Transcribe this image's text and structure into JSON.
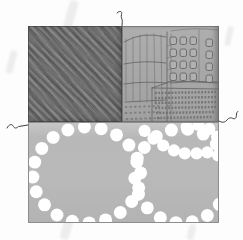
{
  "figure": {
    "kind": "patent-style-figure",
    "panels": [
      {
        "id": "twill-swatch",
        "role": "dark diagonal twill fabric patch, top left"
      },
      {
        "id": "city-sketch-swatch",
        "role": "hand-drawn city buildings fabric patch, top right"
      },
      {
        "id": "dotted-rings-swatch",
        "role": "gray fabric patch with white dotted rings, bottom"
      }
    ],
    "leaders": [
      {
        "id": "leader-top",
        "attaches": "seam between top-left and top-right patches"
      },
      {
        "id": "leader-left",
        "attaches": "left edge of bottom patch"
      },
      {
        "id": "leader-right",
        "attaches": "right edge between top-right and bottom patches"
      }
    ]
  },
  "colors": {
    "page_bg": "#fdfdfd",
    "twill_base": "#6f6f6f",
    "city_bg": "#a9a9a9",
    "sketch_line": "#666666",
    "dots_bg": "#b7b7b7",
    "dot_fill": "#ffffff",
    "leader": "#3f3f3f",
    "edge": "#8d8d8d"
  },
  "swatches": {
    "city": {
      "windows": {
        "cols": [
          48,
          58,
          68
        ],
        "rows": [
          11,
          23,
          35,
          47
        ],
        "extra": {
          "x": 84,
          "rows": [
            13,
            25,
            37,
            49
          ]
        },
        "w": 6.5,
        "h": 7.5
      }
    },
    "dots": {
      "dot_radius": 6.6,
      "chain_dot_radius": 6.2,
      "rings": [
        {
          "cx": 58,
          "cy": 53,
          "rx": 55,
          "ry": 49,
          "n": 20,
          "phase": -1.3
        },
        {
          "cx": 155,
          "cy": 54,
          "rx": 48,
          "ry": 48,
          "n": 18,
          "phase": 0.3
        }
      ],
      "chains": [
        [
          [
            117,
            8
          ],
          [
            126,
            16
          ],
          [
            136,
            23
          ],
          [
            147,
            28
          ],
          [
            158,
            31
          ],
          [
            170,
            31
          ],
          [
            181,
            30
          ],
          [
            192,
            33
          ]
        ],
        [
          [
            160,
            4
          ],
          [
            172,
            2
          ],
          [
            183,
            6
          ],
          [
            191,
            14
          ],
          [
            196,
            25
          ]
        ]
      ]
    }
  }
}
